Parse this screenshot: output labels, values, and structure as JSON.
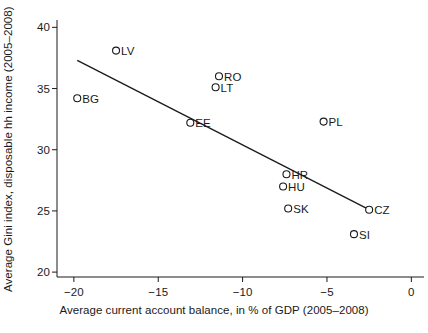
{
  "chart_data": {
    "type": "scatter",
    "title": "",
    "xlabel": "Average current account balance, in % of GDP (2005–2008)",
    "ylabel": "Average Gini index, disposable hh income (2005–2008)",
    "xlim": [
      -21.0,
      0.75
    ],
    "ylim": [
      19.6,
      40.6
    ],
    "xticks": [
      -20,
      -15,
      -10,
      -5,
      0
    ],
    "xtick_labels": [
      "−20",
      "−15",
      "−10",
      "−5",
      "0"
    ],
    "yticks": [
      20,
      25,
      30,
      35,
      40
    ],
    "ytick_labels": [
      "20",
      "25",
      "30",
      "35",
      "40"
    ],
    "grid": false,
    "legend": "none",
    "marker": "open-circle",
    "series": [
      {
        "name": "countries",
        "points": [
          {
            "label": "BG",
            "x": -19.8,
            "y": 34.2,
            "label_side": "right"
          },
          {
            "label": "LV",
            "x": -17.5,
            "y": 38.1,
            "label_side": "right"
          },
          {
            "label": "EE",
            "x": -13.1,
            "y": 32.2,
            "label_side": "right"
          },
          {
            "label": "LT",
            "x": -11.6,
            "y": 35.1,
            "label_side": "right"
          },
          {
            "label": "RO",
            "x": -11.4,
            "y": 36.0,
            "label_side": "right"
          },
          {
            "label": "SK",
            "x": -7.3,
            "y": 25.2,
            "label_side": "right"
          },
          {
            "label": "HU",
            "x": -7.6,
            "y": 27.0,
            "label_side": "right"
          },
          {
            "label": "HR",
            "x": -7.4,
            "y": 28.0,
            "label_side": "right"
          },
          {
            "label": "PL",
            "x": -5.2,
            "y": 32.3,
            "label_side": "right"
          },
          {
            "label": "SI",
            "x": -3.4,
            "y": 23.1,
            "label_side": "right"
          },
          {
            "label": "CZ",
            "x": -2.5,
            "y": 25.1,
            "label_side": "right"
          }
        ]
      }
    ],
    "fit_line": {
      "name": "linear-fit",
      "x1": -19.8,
      "y1": 37.3,
      "x2": -2.5,
      "y2": 25.1
    }
  }
}
